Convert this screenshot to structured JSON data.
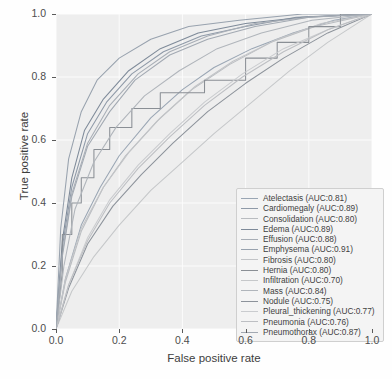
{
  "chart_data": {
    "type": "line",
    "title": "",
    "xlabel": "False positive rate",
    "ylabel": "True positive rate",
    "xlim": [
      0.0,
      1.0
    ],
    "ylim": [
      0.0,
      1.0
    ],
    "xticks": [
      "0.0",
      "0.2",
      "0.4",
      "0.6",
      "0.8",
      "1.0"
    ],
    "yticks": [
      "0.0",
      "0.2",
      "0.4",
      "0.6",
      "0.8",
      "1.0"
    ],
    "grid": true,
    "legend_position": "lower right",
    "series": [
      {
        "name": "Atelectasis",
        "auc": "0.81",
        "label": "Atelectasis (AUC:0.81)",
        "color": "#9aa6b4",
        "points": [
          [
            0,
            0
          ],
          [
            0.03,
            0.16
          ],
          [
            0.08,
            0.33
          ],
          [
            0.14,
            0.45
          ],
          [
            0.2,
            0.55
          ],
          [
            0.3,
            0.67
          ],
          [
            0.4,
            0.76
          ],
          [
            0.5,
            0.83
          ],
          [
            0.62,
            0.89
          ],
          [
            0.75,
            0.94
          ],
          [
            0.88,
            0.98
          ],
          [
            1,
            1
          ]
        ]
      },
      {
        "name": "Cardiomegaly",
        "auc": "0.89",
        "label": "Cardiomegaly (AUC:0.89)",
        "color": "#8f9aa8",
        "points": [
          [
            0,
            0
          ],
          [
            0.02,
            0.26
          ],
          [
            0.05,
            0.45
          ],
          [
            0.1,
            0.62
          ],
          [
            0.16,
            0.72
          ],
          [
            0.24,
            0.81
          ],
          [
            0.34,
            0.88
          ],
          [
            0.46,
            0.93
          ],
          [
            0.6,
            0.96
          ],
          [
            0.76,
            0.99
          ],
          [
            1,
            1
          ]
        ]
      },
      {
        "name": "Consolidation",
        "auc": "0.80",
        "label": "Consolidation (AUC:0.80)",
        "color": "#b9bcc0",
        "points": [
          [
            0,
            0
          ],
          [
            0.03,
            0.15
          ],
          [
            0.08,
            0.31
          ],
          [
            0.15,
            0.45
          ],
          [
            0.22,
            0.55
          ],
          [
            0.32,
            0.66
          ],
          [
            0.43,
            0.76
          ],
          [
            0.55,
            0.84
          ],
          [
            0.68,
            0.91
          ],
          [
            0.82,
            0.96
          ],
          [
            1,
            1
          ]
        ]
      },
      {
        "name": "Edema",
        "auc": "0.89",
        "label": "Edema (AUC:0.89)",
        "color": "#7e8a99",
        "points": [
          [
            0,
            0
          ],
          [
            0.02,
            0.28
          ],
          [
            0.05,
            0.48
          ],
          [
            0.09,
            0.63
          ],
          [
            0.15,
            0.73
          ],
          [
            0.23,
            0.82
          ],
          [
            0.33,
            0.89
          ],
          [
            0.45,
            0.94
          ],
          [
            0.6,
            0.97
          ],
          [
            0.78,
            0.99
          ],
          [
            1,
            1
          ]
        ]
      },
      {
        "name": "Effusion",
        "auc": "0.88",
        "label": "Effusion (AUC:0.88)",
        "color": "#a8aeb6",
        "points": [
          [
            0,
            0
          ],
          [
            0.02,
            0.24
          ],
          [
            0.05,
            0.43
          ],
          [
            0.1,
            0.59
          ],
          [
            0.17,
            0.71
          ],
          [
            0.26,
            0.81
          ],
          [
            0.36,
            0.88
          ],
          [
            0.48,
            0.93
          ],
          [
            0.63,
            0.97
          ],
          [
            0.8,
            0.99
          ],
          [
            1,
            1
          ]
        ]
      },
      {
        "name": "Emphysema",
        "auc": "0.91",
        "label": "Emphysema (AUC:0.91)",
        "color": "#98a2ae",
        "points": [
          [
            0,
            0
          ],
          [
            0.015,
            0.32
          ],
          [
            0.04,
            0.54
          ],
          [
            0.08,
            0.69
          ],
          [
            0.13,
            0.79
          ],
          [
            0.2,
            0.86
          ],
          [
            0.3,
            0.92
          ],
          [
            0.42,
            0.96
          ],
          [
            0.58,
            0.98
          ],
          [
            0.78,
            1
          ],
          [
            1,
            1
          ]
        ]
      },
      {
        "name": "Fibrosis",
        "auc": "0.80",
        "label": "Fibrosis (AUC:0.80)",
        "color": "#c2c4c7",
        "points": [
          [
            0,
            0
          ],
          [
            0.03,
            0.16
          ],
          [
            0.08,
            0.32
          ],
          [
            0.15,
            0.45
          ],
          [
            0.23,
            0.56
          ],
          [
            0.33,
            0.67
          ],
          [
            0.44,
            0.77
          ],
          [
            0.56,
            0.85
          ],
          [
            0.7,
            0.92
          ],
          [
            0.84,
            0.97
          ],
          [
            1,
            1
          ]
        ]
      },
      {
        "name": "Hernia",
        "auc": "0.80",
        "label": "Hernia (AUC:0.80)",
        "color": "#8a8f95",
        "points": [
          [
            0,
            0
          ],
          [
            0.02,
            0.18
          ],
          [
            0.02,
            0.3
          ],
          [
            0.05,
            0.3
          ],
          [
            0.05,
            0.4
          ],
          [
            0.08,
            0.4
          ],
          [
            0.08,
            0.48
          ],
          [
            0.12,
            0.48
          ],
          [
            0.12,
            0.57
          ],
          [
            0.17,
            0.57
          ],
          [
            0.17,
            0.64
          ],
          [
            0.24,
            0.64
          ],
          [
            0.24,
            0.7
          ],
          [
            0.33,
            0.7
          ],
          [
            0.33,
            0.75
          ],
          [
            0.47,
            0.75
          ],
          [
            0.47,
            0.79
          ],
          [
            0.6,
            0.79
          ],
          [
            0.6,
            0.86
          ],
          [
            0.7,
            0.86
          ],
          [
            0.7,
            0.91
          ],
          [
            0.8,
            0.91
          ],
          [
            0.8,
            0.96
          ],
          [
            0.9,
            0.96
          ],
          [
            0.9,
            1
          ],
          [
            1,
            1
          ]
        ]
      },
      {
        "name": "Infiltration",
        "auc": "0.70",
        "label": "Infiltration (AUC:0.70)",
        "color": "#c6c8ca",
        "points": [
          [
            0,
            0
          ],
          [
            0.05,
            0.12
          ],
          [
            0.12,
            0.23
          ],
          [
            0.2,
            0.33
          ],
          [
            0.3,
            0.44
          ],
          [
            0.4,
            0.53
          ],
          [
            0.5,
            0.62
          ],
          [
            0.62,
            0.72
          ],
          [
            0.74,
            0.82
          ],
          [
            0.86,
            0.91
          ],
          [
            1,
            1
          ]
        ]
      },
      {
        "name": "Mass",
        "auc": "0.84",
        "label": "Mass (AUC:0.84)",
        "color": "#b0b5bb",
        "points": [
          [
            0,
            0
          ],
          [
            0.025,
            0.2
          ],
          [
            0.06,
            0.38
          ],
          [
            0.12,
            0.53
          ],
          [
            0.19,
            0.64
          ],
          [
            0.28,
            0.74
          ],
          [
            0.39,
            0.82
          ],
          [
            0.51,
            0.89
          ],
          [
            0.65,
            0.94
          ],
          [
            0.81,
            0.98
          ],
          [
            1,
            1
          ]
        ]
      },
      {
        "name": "Nodule",
        "auc": "0.75",
        "label": "Nodule (AUC:0.75)",
        "color": "#8d939b",
        "points": [
          [
            0,
            0
          ],
          [
            0.04,
            0.13
          ],
          [
            0.1,
            0.27
          ],
          [
            0.18,
            0.39
          ],
          [
            0.27,
            0.49
          ],
          [
            0.37,
            0.59
          ],
          [
            0.48,
            0.69
          ],
          [
            0.6,
            0.78
          ],
          [
            0.72,
            0.86
          ],
          [
            0.86,
            0.94
          ],
          [
            1,
            1
          ]
        ]
      },
      {
        "name": "Pleural_thickening",
        "auc": "0.77",
        "label": "Pleural_thickening (AUC:0.77)",
        "color": "#cacccf",
        "points": [
          [
            0,
            0
          ],
          [
            0.04,
            0.14
          ],
          [
            0.1,
            0.29
          ],
          [
            0.17,
            0.41
          ],
          [
            0.26,
            0.52
          ],
          [
            0.36,
            0.62
          ],
          [
            0.47,
            0.72
          ],
          [
            0.59,
            0.81
          ],
          [
            0.72,
            0.89
          ],
          [
            0.86,
            0.95
          ],
          [
            1,
            1
          ]
        ]
      },
      {
        "name": "Pneumonia",
        "auc": "0.76",
        "label": "Pneumonia (AUC:0.76)",
        "color": "#bdbfc3",
        "points": [
          [
            0,
            0
          ],
          [
            0.04,
            0.14
          ],
          [
            0.1,
            0.28
          ],
          [
            0.17,
            0.4
          ],
          [
            0.26,
            0.51
          ],
          [
            0.36,
            0.61
          ],
          [
            0.47,
            0.71
          ],
          [
            0.59,
            0.8
          ],
          [
            0.72,
            0.88
          ],
          [
            0.86,
            0.95
          ],
          [
            1,
            1
          ]
        ]
      },
      {
        "name": "Pneumothorax",
        "auc": "0.87",
        "label": "Pneumothorax (AUC:0.87)",
        "color": "#a2a9b2",
        "points": [
          [
            0,
            0
          ],
          [
            0.02,
            0.23
          ],
          [
            0.05,
            0.42
          ],
          [
            0.1,
            0.58
          ],
          [
            0.17,
            0.69
          ],
          [
            0.25,
            0.79
          ],
          [
            0.36,
            0.87
          ],
          [
            0.48,
            0.92
          ],
          [
            0.63,
            0.96
          ],
          [
            0.8,
            0.99
          ],
          [
            1,
            1
          ]
        ]
      }
    ]
  }
}
